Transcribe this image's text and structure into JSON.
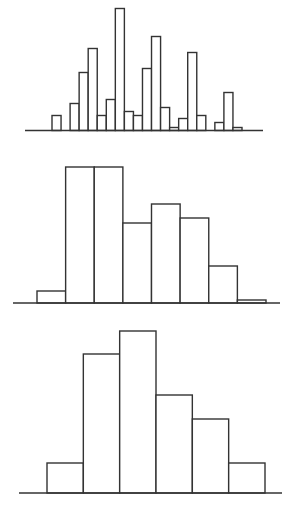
{
  "chart_data": [
    {
      "type": "bar",
      "title": "",
      "xlabel": "",
      "ylabel": "",
      "description": "Histogram with many narrow bins (multimodal)",
      "categories": [
        "1",
        "2",
        "3",
        "4",
        "5",
        "6",
        "7",
        "8",
        "9",
        "10",
        "11",
        "12",
        "13",
        "14",
        "15",
        "16",
        "17",
        "18",
        "19",
        "20",
        "21"
      ],
      "values": [
        15,
        0,
        27,
        58,
        82,
        15,
        31,
        122,
        19,
        15,
        62,
        94,
        23,
        3,
        12,
        78,
        15,
        0,
        8,
        38,
        3
      ],
      "grid": false,
      "layout": {
        "x0": 52,
        "x1": 242,
        "baseline_y": 130.5,
        "axis_x0": 25,
        "axis_x1": 263
      }
    },
    {
      "type": "bar",
      "title": "",
      "xlabel": "",
      "ylabel": "",
      "description": "Histogram with medium bins",
      "categories": [
        "1",
        "2",
        "3",
        "4",
        "5",
        "6",
        "7",
        "8"
      ],
      "values": [
        12,
        136,
        136,
        80,
        99,
        85,
        37,
        3
      ],
      "grid": false,
      "layout": {
        "x0": 37,
        "x1": 266,
        "baseline_y": 303,
        "axis_x0": 13,
        "axis_x1": 280
      }
    },
    {
      "type": "bar",
      "title": "",
      "xlabel": "",
      "ylabel": "",
      "description": "Histogram with wide bins",
      "categories": [
        "1",
        "2",
        "3",
        "4",
        "5",
        "6"
      ],
      "values": [
        30,
        139,
        162,
        98,
        74,
        30
      ],
      "grid": false,
      "layout": {
        "x0": 47,
        "x1": 265,
        "baseline_y": 493,
        "axis_x0": 19,
        "axis_x1": 282
      }
    }
  ]
}
